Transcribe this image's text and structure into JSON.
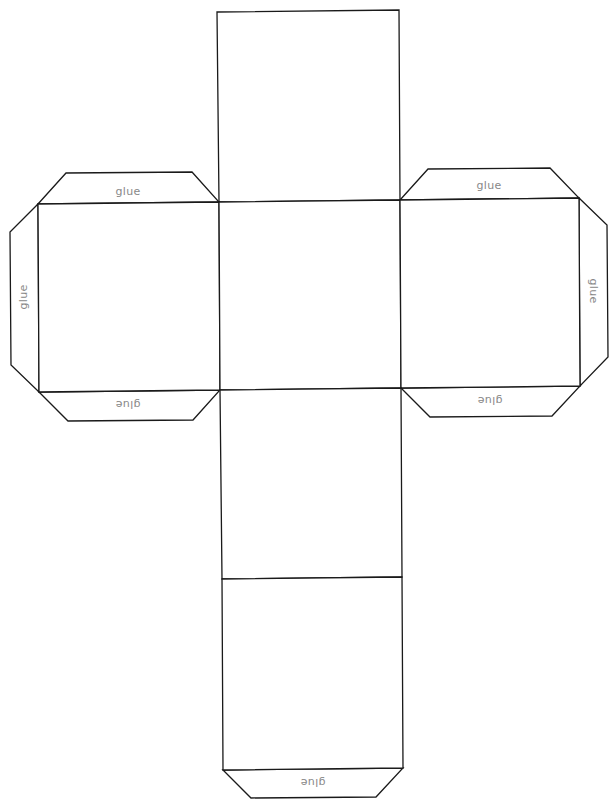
{
  "diagram": {
    "line_color": "#1a1a1a",
    "label_color": "#888888",
    "faces": [
      {
        "name": "top-face",
        "points": "217,12 399,10 400,200 219,202"
      },
      {
        "name": "left-face",
        "points": "38,204 219,202 220,390 39,392"
      },
      {
        "name": "center-face",
        "points": "219,202 400,200 401,388 220,390"
      },
      {
        "name": "right-face",
        "points": "400,200 579,198 580,386 401,388"
      },
      {
        "name": "lower-face",
        "points": "220,390 401,388 402,577 222,579"
      },
      {
        "name": "bottom-face",
        "points": "222,579 402,577 403,768 223,770"
      }
    ],
    "tabs": [
      {
        "name": "left-top-tab",
        "points": "38,204 66,173 192,172 219,202",
        "label": "glue",
        "lx": 128,
        "ly": 192,
        "rot": 0
      },
      {
        "name": "left-side-tab",
        "points": "38,204 10,232 11,365 39,392",
        "label": "glue",
        "lx": 24,
        "ly": 297,
        "rot": -90
      },
      {
        "name": "left-bottom-tab",
        "points": "39,392 68,421 193,420 220,390",
        "label": "glue",
        "lx": 128,
        "ly": 404,
        "rot": 180
      },
      {
        "name": "right-top-tab",
        "points": "400,200 428,169 550,168 579,198",
        "label": "glue",
        "lx": 489,
        "ly": 186,
        "rot": 0
      },
      {
        "name": "right-side-tab",
        "points": "579,198 607,225 608,357 580,386",
        "label": "glue",
        "lx": 593,
        "ly": 291,
        "rot": 90
      },
      {
        "name": "right-bottom-tab",
        "points": "401,388 430,417 552,416 580,386",
        "label": "glue",
        "lx": 490,
        "ly": 400,
        "rot": 180
      },
      {
        "name": "bottom-tab",
        "points": "223,770 251,798 376,797 403,768",
        "label": "glue",
        "lx": 313,
        "ly": 782,
        "rot": 180
      }
    ]
  }
}
